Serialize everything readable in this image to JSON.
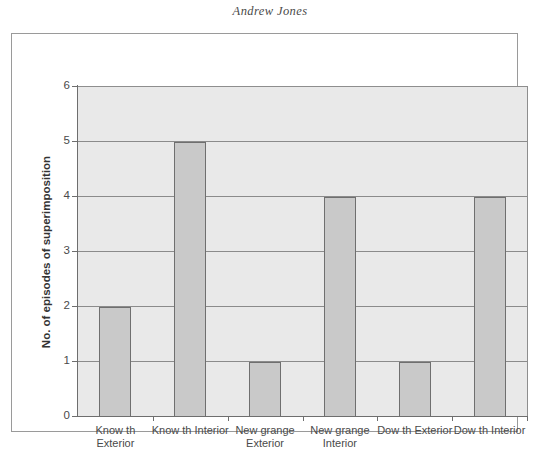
{
  "page": {
    "running_head": "Andrew Jones"
  },
  "chart_data": {
    "type": "bar",
    "title": "",
    "xlabel": "",
    "ylabel": "No. of episodes of superimposition",
    "categories": [
      "Know th Exterior",
      "Know th Interior",
      "New grange Exterior",
      "New grange Interior",
      "Dow th Exterior",
      "Dow th Interior"
    ],
    "category_lines": [
      [
        "Know th",
        "Exterior"
      ],
      [
        "Know th Interior",
        ""
      ],
      [
        "New grange",
        "Exterior"
      ],
      [
        "New grange",
        "Interior"
      ],
      [
        "Dow th Exterior",
        ""
      ],
      [
        "Dow th Interior",
        ""
      ]
    ],
    "values": [
      2,
      5,
      1,
      4,
      1,
      4
    ],
    "ylim": [
      0,
      6
    ],
    "yticks": [
      0,
      1,
      2,
      3,
      4,
      5,
      6
    ],
    "ytick_labels": [
      "0",
      "1",
      "2",
      "3",
      "4",
      "5",
      "6"
    ],
    "grid": true,
    "legend": false,
    "colors": {
      "bar_fill": "#c9c9c9",
      "bar_border": "#6f6f6f",
      "plot_background": "#e9e9e9",
      "gridline": "#8b8b8b",
      "axis": "#6e6e6e",
      "frame": "#9a9a9a",
      "text": "#4a4a4a"
    }
  }
}
